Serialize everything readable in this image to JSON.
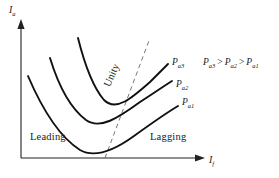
{
  "chart_data": {
    "type": "line",
    "title": "",
    "xlabel": "I_f",
    "ylabel": "I_a",
    "axes": {
      "x_label_main": "I",
      "x_label_sub": "f",
      "y_label_main": "I",
      "y_label_sub": "a",
      "grid": false,
      "arrows": true
    },
    "series": [
      {
        "name": "P_a3",
        "label_main": "P",
        "label_sub": "a3",
        "description": "highest power V-curve, topmost",
        "path": "M 78,38 C 84,62 92,86 104,100 C 116,112 132,98 150,82 C 158,74 164,68 168,64"
      },
      {
        "name": "P_a2",
        "label_main": "P",
        "label_sub": "a2",
        "description": "middle power V-curve",
        "path": "M 50,58 C 58,84 70,108 86,120 C 100,130 118,118 140,102 C 154,93 164,86 172,81"
      },
      {
        "name": "P_a1",
        "label_main": "P",
        "label_sub": "a1",
        "description": "lowest power V-curve, minimum touches the I_f axis",
        "path": "M 28,76 C 40,104 58,136 80,150 C 94,158 112,152 134,136 C 152,123 168,112 178,106"
      }
    ],
    "unity_line": {
      "label": "Unity",
      "style": "dashed",
      "description": "locus of unity power factor joining the minima of all V-curves",
      "from": [
        105,
        158
      ],
      "to": [
        150,
        38
      ]
    },
    "regions": [
      {
        "name": "leading",
        "label": "Leading",
        "side": "left-of-unity-line"
      },
      {
        "name": "lagging",
        "label": "Lagging",
        "side": "right-of-unity-line"
      }
    ],
    "inequality": {
      "terms": [
        {
          "main": "P",
          "sub": "a3"
        },
        {
          "main": "P",
          "sub": "a2"
        },
        {
          "main": "P",
          "sub": "a1"
        }
      ],
      "operator": ">",
      "text": "P_a3 > P_a2 > P_a1"
    },
    "colors": {
      "background": "#ffffff",
      "curve": "#111111",
      "axis": "#222222",
      "dashed": "#555555",
      "text": "#1a1a1a"
    }
  }
}
